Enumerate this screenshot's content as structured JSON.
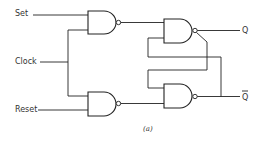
{
  "diagram": {
    "caption": "(a)",
    "inputs": [
      {
        "id": "set",
        "label": "Set"
      },
      {
        "id": "clock",
        "label": "Clock"
      },
      {
        "id": "reset",
        "label": "Reset"
      }
    ],
    "outputs": [
      {
        "id": "q",
        "label": "Q"
      },
      {
        "id": "q_bar",
        "label": "Q"
      }
    ],
    "gates": [
      {
        "id": "g1",
        "type": "NAND",
        "inputs": [
          "Set",
          "Clock"
        ],
        "output": "to g3"
      },
      {
        "id": "g2",
        "type": "NAND",
        "inputs": [
          "Clock",
          "Reset"
        ],
        "output": "to g4"
      },
      {
        "id": "g3",
        "type": "NAND",
        "inputs": [
          "g1",
          "g4 (Q̄)"
        ],
        "output": "Q"
      },
      {
        "id": "g4",
        "type": "NAND",
        "inputs": [
          "g3 (Q)",
          "g2"
        ],
        "output": "Q̄"
      }
    ],
    "colors": {
      "line": "#222222",
      "text": "#333333",
      "background": "#ffffff"
    }
  }
}
